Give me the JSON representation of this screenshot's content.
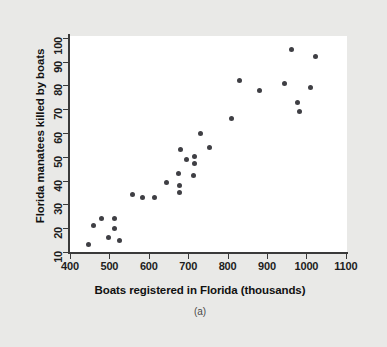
{
  "figure": {
    "caption": "(a)",
    "background_color": "#e9e9e7",
    "panel_color": "#ffffff",
    "marker_color": "#3f3f44",
    "axis_color": "#3a3a3a"
  },
  "chart_data": {
    "type": "scatter",
    "title": "",
    "xlabel": "Boats registered in Florida (thousands)",
    "ylabel": "Florida manatees killed by boats",
    "xlim": [
      380,
      1130
    ],
    "ylim": [
      8,
      103
    ],
    "xticks": [
      400,
      500,
      600,
      700,
      800,
      900,
      1000,
      1100
    ],
    "yticks": [
      10,
      20,
      30,
      40,
      50,
      60,
      70,
      80,
      90,
      100
    ],
    "xtick_labels": [
      "400",
      "500",
      "600",
      "700",
      "800",
      "900",
      "1000",
      "1100"
    ],
    "ytick_labels": [
      "10",
      "20",
      "30",
      "40",
      "50",
      "60",
      "70",
      "80",
      "90",
      "100"
    ],
    "grid": false,
    "legend": null,
    "points": [
      {
        "x": 447,
        "y": 13
      },
      {
        "x": 460,
        "y": 21
      },
      {
        "x": 481,
        "y": 24
      },
      {
        "x": 498,
        "y": 16
      },
      {
        "x": 513,
        "y": 24
      },
      {
        "x": 512,
        "y": 20
      },
      {
        "x": 526,
        "y": 15
      },
      {
        "x": 559,
        "y": 34
      },
      {
        "x": 585,
        "y": 33
      },
      {
        "x": 614,
        "y": 33
      },
      {
        "x": 645,
        "y": 39
      },
      {
        "x": 675,
        "y": 43
      },
      {
        "x": 679,
        "y": 38
      },
      {
        "x": 678,
        "y": 35
      },
      {
        "x": 696,
        "y": 49
      },
      {
        "x": 713,
        "y": 42
      },
      {
        "x": 732,
        "y": 60
      },
      {
        "x": 755,
        "y": 54
      },
      {
        "x": 809,
        "y": 66
      },
      {
        "x": 830,
        "y": 82
      },
      {
        "x": 880,
        "y": 78
      },
      {
        "x": 944,
        "y": 81
      },
      {
        "x": 962,
        "y": 95
      },
      {
        "x": 978,
        "y": 73
      },
      {
        "x": 983,
        "y": 69
      },
      {
        "x": 1010,
        "y": 79
      },
      {
        "x": 1024,
        "y": 92
      },
      {
        "x": 681,
        "y": 53
      },
      {
        "x": 716,
        "y": 50
      },
      {
        "x": 716,
        "y": 47
      }
    ]
  }
}
